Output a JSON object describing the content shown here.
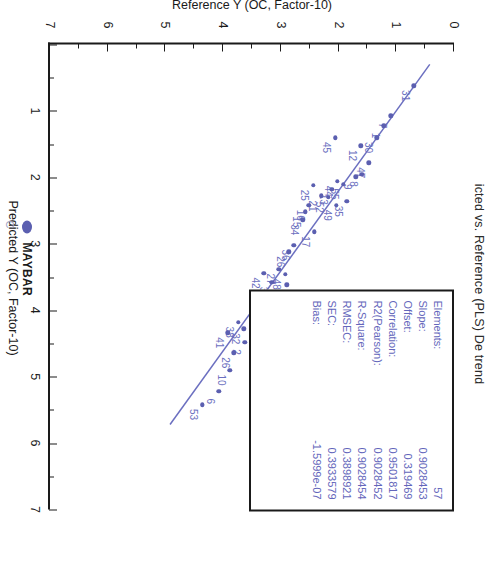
{
  "chart_data": {
    "type": "scatter",
    "title": "icted vs. Reference (PLS) De trend",
    "xlabel": "Predicted Y (OC, Factor-10)",
    "ylabel": "Reference Y (OC, Factor-10)",
    "xlim": [
      0,
      7
    ],
    "ylim": [
      0,
      7
    ],
    "xticks": [
      0,
      1,
      2,
      3,
      4,
      5,
      6,
      7
    ],
    "yticks": [
      0,
      1,
      2,
      3,
      4,
      5,
      6,
      7
    ],
    "grid": false,
    "legend_position": "bottom",
    "series": [
      {
        "name": "MAYBAR",
        "color": "#5b5fb0",
        "marker": "circle",
        "points": [
          {
            "label": "31",
            "x": 0.62,
            "y": 0.7
          },
          {
            "label": "7",
            "x": 1.07,
            "y": 1.1
          },
          {
            "label": "1",
            "x": 1.22,
            "y": 1.22
          },
          {
            "label": "30",
            "x": 1.4,
            "y": 1.34
          },
          {
            "label": "12",
            "x": 1.52,
            "y": 1.62
          },
          {
            "label": "47",
            "x": 1.78,
            "y": 1.48
          },
          {
            "label": "8",
            "x": 1.95,
            "y": 1.6
          },
          {
            "label": "9",
            "x": 1.99,
            "y": 1.7
          },
          {
            "label": "55",
            "x": 2.1,
            "y": 1.92
          },
          {
            "label": "35",
            "x": 2.36,
            "y": 1.86
          },
          {
            "label": "45",
            "x": 1.4,
            "y": 2.06
          },
          {
            "label": "44",
            "x": 2.06,
            "y": 2.02
          },
          {
            "label": "13",
            "x": 2.18,
            "y": 2.12
          },
          {
            "label": "52",
            "x": 2.3,
            "y": 2.18
          },
          {
            "label": "49",
            "x": 2.42,
            "y": 2.04
          },
          {
            "label": "21",
            "x": 2.28,
            "y": 2.3
          },
          {
            "label": "25",
            "x": 2.12,
            "y": 2.44
          },
          {
            "label": "16",
            "x": 2.42,
            "y": 2.52
          },
          {
            "label": "15",
            "x": 2.52,
            "y": 2.58
          },
          {
            "label": "34",
            "x": 2.64,
            "y": 2.62
          },
          {
            "label": "17",
            "x": 2.82,
            "y": 2.42
          },
          {
            "label": "36",
            "x": 3.02,
            "y": 2.78
          },
          {
            "label": "26",
            "x": 3.12,
            "y": 2.86
          },
          {
            "label": "48",
            "x": 3.46,
            "y": 2.92
          },
          {
            "label": "40",
            "x": 3.62,
            "y": 2.9
          },
          {
            "label": "27",
            "x": 3.38,
            "y": 3.04
          },
          {
            "label": "39",
            "x": 3.58,
            "y": 3.16
          },
          {
            "label": "42",
            "x": 3.44,
            "y": 3.3
          },
          {
            "label": "56",
            "x": 3.96,
            "y": 3.32
          },
          {
            "label": "2",
            "x": 4.48,
            "y": 3.62
          },
          {
            "label": "32",
            "x": 4.28,
            "y": 3.64
          },
          {
            "label": "38",
            "x": 4.18,
            "y": 3.74
          },
          {
            "label": "41",
            "x": 4.34,
            "y": 3.92
          },
          {
            "label": "26b",
            "x": 4.64,
            "y": 3.82
          },
          {
            "label": "10",
            "x": 4.9,
            "y": 3.88
          },
          {
            "label": "6",
            "x": 5.22,
            "y": 4.08
          },
          {
            "label": "53",
            "x": 5.42,
            "y": 4.36
          }
        ]
      }
    ],
    "regression_line": {
      "x0": 0.3,
      "y0": 0.42,
      "x1": 5.72,
      "y1": 4.92,
      "color": "#6b6fc0"
    },
    "stats": {
      "rows": [
        {
          "key": "Elements:",
          "value": "57"
        },
        {
          "key": "Slope:",
          "value": "0.9028453"
        },
        {
          "key": "Offset:",
          "value": "0.319469"
        },
        {
          "key": "Correlation:",
          "value": "0.9501817"
        },
        {
          "key": "R2(Pearson):",
          "value": "0.9028452"
        },
        {
          "key": "R-Square:",
          "value": "0.9028454"
        },
        {
          "key": "RMSEC:",
          "value": "0.3898921"
        },
        {
          "key": "SEC:",
          "value": "0.3933579"
        },
        {
          "key": "Bias:",
          "value": "-1.5999e-07"
        }
      ]
    },
    "legend": {
      "marker_label": "MAYBAR",
      "sub_label": "C"
    }
  }
}
